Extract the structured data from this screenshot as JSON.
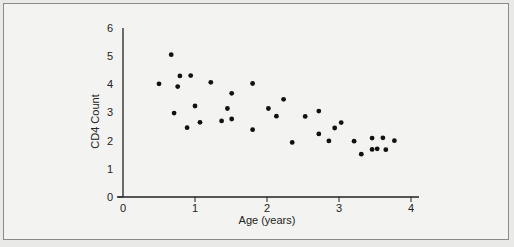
{
  "chart_data": {
    "type": "scatter",
    "title": "",
    "xlabel": "Age (years)",
    "ylabel": "CD4 Count",
    "xlim": [
      0,
      4
    ],
    "ylim": [
      0,
      6
    ],
    "xticks": [
      "0",
      "1",
      "2",
      "3",
      "4"
    ],
    "yticks": [
      "0",
      "1",
      "2",
      "3",
      "4",
      "5",
      "6"
    ],
    "grid": false,
    "legend": null,
    "points": [
      {
        "x": 0.5,
        "y": 4.02
      },
      {
        "x": 0.67,
        "y": 5.05
      },
      {
        "x": 0.71,
        "y": 2.98
      },
      {
        "x": 0.76,
        "y": 3.92
      },
      {
        "x": 0.79,
        "y": 4.3
      },
      {
        "x": 0.89,
        "y": 2.46
      },
      {
        "x": 0.94,
        "y": 4.31
      },
      {
        "x": 1.0,
        "y": 3.23
      },
      {
        "x": 1.07,
        "y": 2.65
      },
      {
        "x": 1.22,
        "y": 4.07
      },
      {
        "x": 1.37,
        "y": 2.7
      },
      {
        "x": 1.45,
        "y": 3.14
      },
      {
        "x": 1.51,
        "y": 3.68
      },
      {
        "x": 1.51,
        "y": 2.77
      },
      {
        "x": 1.8,
        "y": 4.03
      },
      {
        "x": 1.8,
        "y": 2.39
      },
      {
        "x": 2.02,
        "y": 3.14
      },
      {
        "x": 2.13,
        "y": 2.87
      },
      {
        "x": 2.23,
        "y": 3.47
      },
      {
        "x": 2.35,
        "y": 1.94
      },
      {
        "x": 2.53,
        "y": 2.86
      },
      {
        "x": 2.72,
        "y": 3.05
      },
      {
        "x": 2.72,
        "y": 2.24
      },
      {
        "x": 2.86,
        "y": 1.99
      },
      {
        "x": 2.94,
        "y": 2.45
      },
      {
        "x": 3.03,
        "y": 2.64
      },
      {
        "x": 3.21,
        "y": 1.98
      },
      {
        "x": 3.31,
        "y": 1.52
      },
      {
        "x": 3.46,
        "y": 2.09
      },
      {
        "x": 3.46,
        "y": 1.69
      },
      {
        "x": 3.53,
        "y": 1.71
      },
      {
        "x": 3.61,
        "y": 2.1
      },
      {
        "x": 3.65,
        "y": 1.68
      },
      {
        "x": 3.77,
        "y": 2.0
      }
    ]
  },
  "axes": {
    "xlabel": "Age (years)",
    "ylabel": "CD4 Count"
  }
}
